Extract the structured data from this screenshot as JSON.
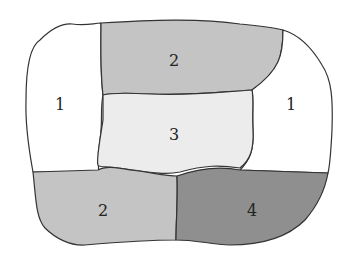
{
  "diagram": {
    "type": "map-coloring",
    "regions": [
      {
        "id": "left",
        "label": "1",
        "fill": "#ffffff"
      },
      {
        "id": "top",
        "label": "2",
        "fill": "#c4c4c4"
      },
      {
        "id": "right",
        "label": "1",
        "fill": "#ffffff"
      },
      {
        "id": "center",
        "label": "3",
        "fill": "#ececec"
      },
      {
        "id": "bottom-left",
        "label": "2",
        "fill": "#c4c4c4"
      },
      {
        "id": "bottom-right",
        "label": "4",
        "fill": "#8f8f8f"
      }
    ]
  }
}
